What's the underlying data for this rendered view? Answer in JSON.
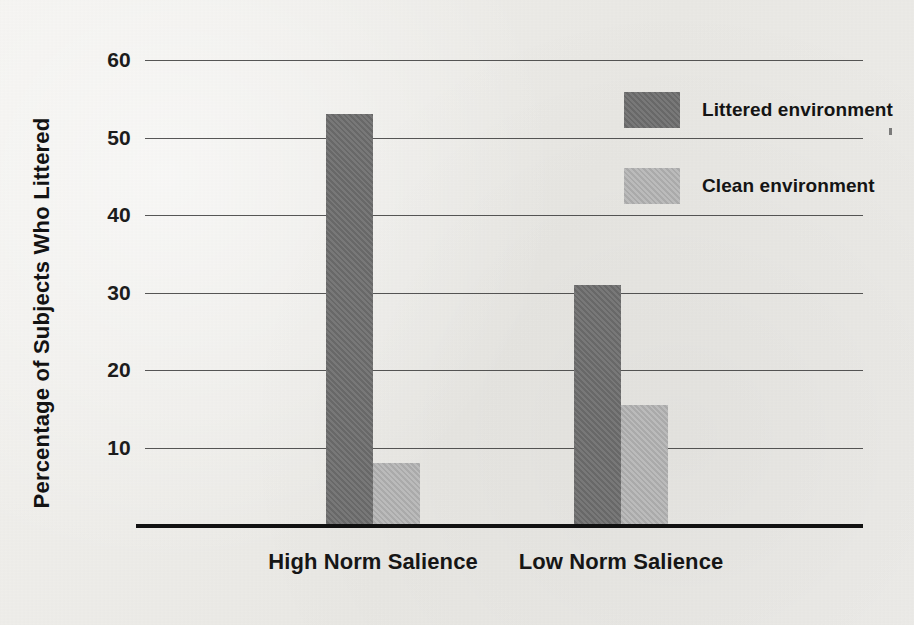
{
  "chart_data": {
    "type": "bar",
    "title": "",
    "xlabel": "",
    "ylabel": "Percentage of Subjects Who Littered",
    "categories": [
      "High Norm Salience",
      "Low Norm Salience"
    ],
    "series": [
      {
        "name": "Littered environment",
        "color": "#6e6e6e",
        "values": [
          53,
          31
        ]
      },
      {
        "name": "Clean environment",
        "color": "#b3b3b3",
        "values": [
          8,
          15.5
        ]
      }
    ],
    "ylim": [
      0,
      60
    ],
    "yticks": [
      10,
      20,
      30,
      40,
      50,
      60
    ],
    "ytick_labels": [
      "10",
      "20",
      "30",
      "40",
      "50",
      "60"
    ],
    "grid": true,
    "legend_position": "top-right",
    "legend_entries": [
      "Littered environment",
      "Clean environment"
    ],
    "annotations": []
  },
  "legend": {
    "items": [
      {
        "label": "Littered environment",
        "swatch": "dark-gray-swatch"
      },
      {
        "label": "Clean environment",
        "swatch": "light-gray-swatch"
      }
    ]
  },
  "axes": {
    "y_title": "Percentage of Subjects Who Littered",
    "y_ticks": [
      "60",
      "50",
      "40",
      "30",
      "20",
      "10"
    ],
    "x_categories": [
      "High Norm Salience",
      "Low Norm Salience"
    ]
  },
  "colors": {
    "background": "#edece9",
    "dark_bar": "#6e6e6e",
    "light_bar": "#b3b3b3",
    "gridline": "#3a3a3a",
    "baseline": "#111111",
    "text": "#141414"
  }
}
